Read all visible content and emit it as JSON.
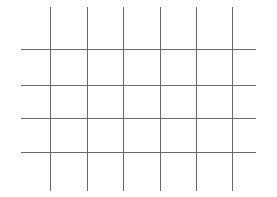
{
  "figure": {
    "type": "grid",
    "line_color": "#6a6a6a",
    "background": "#ffffff",
    "vertical_lines": {
      "count": 6,
      "x": [
        50,
        87,
        123,
        160,
        196,
        232
      ],
      "y_start": 7,
      "y_end": 191
    },
    "horizontal_lines": {
      "count": 4,
      "y": [
        49,
        85,
        118,
        152
      ],
      "x_start": 21,
      "x_end": 256
    },
    "cells": {
      "columns": 5,
      "rows": 3
    }
  }
}
